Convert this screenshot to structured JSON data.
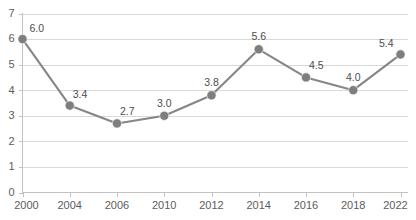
{
  "chart_data": {
    "type": "line",
    "title": "",
    "xlabel": "",
    "ylabel": "",
    "categories": [
      "2000",
      "2004",
      "2006",
      "2010",
      "2012",
      "2014",
      "2016",
      "2018",
      "2022"
    ],
    "values": [
      6.0,
      3.4,
      2.7,
      3.0,
      3.8,
      5.6,
      4.5,
      4.0,
      5.4
    ],
    "data_labels": [
      "6.0",
      "3.4",
      "2.7",
      "3.0",
      "3.8",
      "5.6",
      "4.5",
      "4.0",
      "5.4"
    ],
    "ylim": [
      0,
      7
    ],
    "ytick_labels": [
      "0",
      "1",
      "2",
      "3",
      "4",
      "5",
      "6",
      "7"
    ],
    "ytick_values": [
      0,
      1,
      2,
      3,
      4,
      5,
      6,
      7
    ],
    "grid": true,
    "grid_axis": "y",
    "legend": null,
    "series_color": "#868686",
    "marker_color": "#7e7e7e",
    "grid_color": "#d9d9d9",
    "axis_color": "#c2c2c2",
    "label_color": "#5c5c5c",
    "data_label_color": "#4d4d4d",
    "background": "#ffffff"
  }
}
